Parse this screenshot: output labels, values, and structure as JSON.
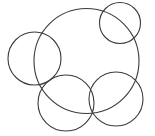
{
  "figure": {
    "width": 155,
    "height": 136,
    "background_color": "#ffffff",
    "stroke_color": "#3b3b3b",
    "stroke_width": 1.1
  },
  "chart_data": {
    "type": "scatter",
    "title": "",
    "subtitle": "",
    "xlabel": "",
    "ylabel": "",
    "xlim": [
      0,
      155
    ],
    "ylim": [
      0,
      136
    ],
    "grid": false,
    "legend": "none",
    "annotations": [],
    "shapes": [
      {
        "name": "large-center-circle",
        "type": "circle",
        "cx": 86.5,
        "cy": 61,
        "r": 52.5,
        "stroke": "#3b3b3b",
        "stroke_width": 1.1,
        "fill": "none"
      },
      {
        "name": "top-right-circle",
        "type": "circle",
        "cx": 120,
        "cy": 23,
        "r": 20.5,
        "stroke": "#3b3b3b",
        "stroke_width": 1.1,
        "fill": "none"
      },
      {
        "name": "left-circle",
        "type": "circle",
        "cx": 34.5,
        "cy": 58.5,
        "r": 26.5,
        "stroke": "#3b3b3b",
        "stroke_width": 1.1,
        "fill": "none"
      },
      {
        "name": "bottom-left-circle",
        "type": "circle",
        "cx": 66,
        "cy": 103,
        "r": 28,
        "stroke": "#3b3b3b",
        "stroke_width": 1.1,
        "fill": "none"
      },
      {
        "name": "bottom-right-circle",
        "type": "circle",
        "cx": 116,
        "cy": 99,
        "r": 27,
        "stroke": "#3b3b3b",
        "stroke_width": 1.1,
        "fill": "none"
      }
    ]
  }
}
